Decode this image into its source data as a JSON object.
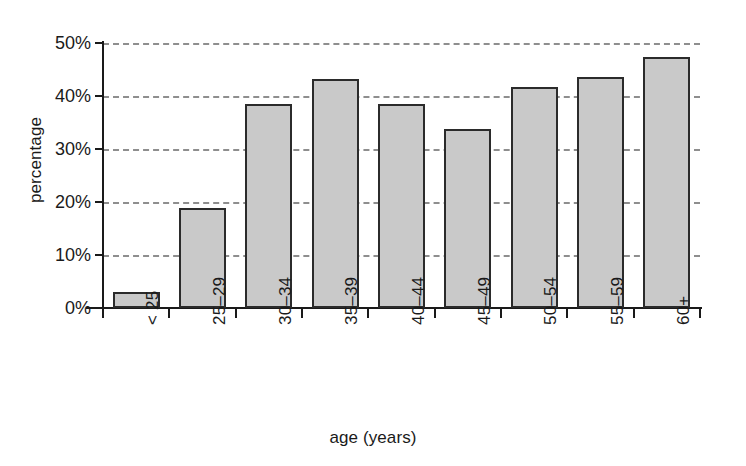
{
  "chart_data": {
    "type": "bar",
    "title": "",
    "xlabel": "age (years)",
    "ylabel": "percentage",
    "categories": [
      "< 25",
      "25–29",
      "30–34",
      "35–39",
      "40–44",
      "45–49",
      "50–54",
      "55–59",
      "60+"
    ],
    "values": [
      3,
      18.9,
      38.5,
      43.3,
      38.5,
      33.7,
      41.7,
      43.5,
      47.3
    ],
    "ylim": [
      0,
      50
    ],
    "ytick_values": [
      0,
      10,
      20,
      30,
      40,
      50
    ],
    "ytick_labels": [
      "0%",
      "10%",
      "20%",
      "30%",
      "40%",
      "50%"
    ],
    "grid": true,
    "grid_axis": "y",
    "grid_style": "dashed",
    "legend": "none",
    "bar_fill_color": "#c9c9c9",
    "bar_edge_color": "#2b2b2b",
    "grid_color": "#8e8e8e",
    "axis_color": "#1a1a1a",
    "background_color": "#ffffff",
    "xtick_label_rotation": 90
  }
}
